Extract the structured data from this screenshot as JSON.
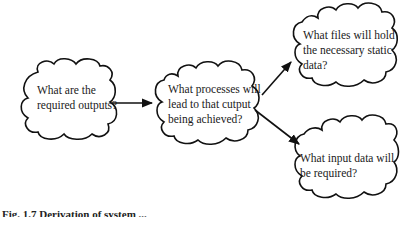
{
  "diagram": {
    "nodes": [
      {
        "id": "outputs",
        "lines": [
          "What are the",
          "required outputs?"
        ]
      },
      {
        "id": "processes",
        "lines": [
          "What processes will",
          "lead to that cutput",
          "being achieved?"
        ]
      },
      {
        "id": "files",
        "lines": [
          "What files will hold",
          "the necessary static",
          "data?"
        ]
      },
      {
        "id": "inputs",
        "lines": [
          "What input data will",
          "be required?"
        ]
      }
    ],
    "edges": [
      {
        "from": "outputs",
        "to": "processes"
      },
      {
        "from": "processes",
        "to": "files"
      },
      {
        "from": "processes",
        "to": "inputs"
      }
    ],
    "caption": "Fig. 1.7 Derivation of system ..."
  }
}
